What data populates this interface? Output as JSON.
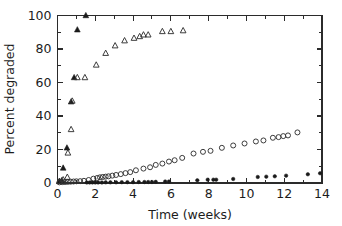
{
  "chart_data": {
    "type": "scatter",
    "title": "",
    "xlabel": "Time (weeks)",
    "ylabel": "Percent degraded",
    "xlim": [
      0,
      14
    ],
    "ylim": [
      0,
      100
    ],
    "xticks": [
      0,
      2,
      4,
      6,
      8,
      10,
      12,
      14
    ],
    "xtick_labels": [
      "0",
      "2",
      "4",
      "6",
      "8",
      "10",
      "12",
      "14"
    ],
    "yticks": [
      0,
      20,
      40,
      60,
      80,
      100
    ],
    "ytick_labels": [
      "0",
      "20",
      "40",
      "60",
      "80",
      "100"
    ],
    "x_minor_ticks": [
      1,
      3,
      5,
      7,
      9,
      11,
      13
    ],
    "y_minor_ticks": [
      10,
      30,
      50,
      70,
      90
    ],
    "grid": false,
    "legend": "none",
    "series": [
      {
        "name": "filled-triangles",
        "marker": "filled-triangle",
        "color": "#1a1a1a",
        "points": [
          [
            0.1,
            1.0
          ],
          [
            0.22,
            1.5
          ],
          [
            0.3,
            9.0
          ],
          [
            0.5,
            21.0
          ],
          [
            0.72,
            48.5
          ],
          [
            0.88,
            63.0
          ],
          [
            1.05,
            91.5
          ],
          [
            1.5,
            100.0
          ]
        ]
      },
      {
        "name": "open-triangles",
        "marker": "open-triangle",
        "color": "#333333",
        "points": [
          [
            0.1,
            1.0
          ],
          [
            0.3,
            2.0
          ],
          [
            0.52,
            3.5
          ],
          [
            0.55,
            18.0
          ],
          [
            0.72,
            32.0
          ],
          [
            0.78,
            49.0
          ],
          [
            1.05,
            63.0
          ],
          [
            1.45,
            63.0
          ],
          [
            2.05,
            70.5
          ],
          [
            2.55,
            77.5
          ],
          [
            3.05,
            82.0
          ],
          [
            3.55,
            85.0
          ],
          [
            4.05,
            86.5
          ],
          [
            4.35,
            87.5
          ],
          [
            4.55,
            88.5
          ],
          [
            4.8,
            88.5
          ],
          [
            5.55,
            90.5
          ],
          [
            6.0,
            90.5
          ],
          [
            6.65,
            91.0
          ]
        ]
      },
      {
        "name": "open-circles",
        "marker": "open-circle",
        "color": "#333333",
        "points": [
          [
            0.1,
            0.4
          ],
          [
            0.25,
            0.5
          ],
          [
            0.4,
            0.6
          ],
          [
            0.55,
            0.7
          ],
          [
            0.7,
            0.8
          ],
          [
            0.85,
            0.9
          ],
          [
            1.0,
            1.0
          ],
          [
            1.2,
            1.1
          ],
          [
            1.4,
            1.3
          ],
          [
            1.65,
            1.8
          ],
          [
            1.9,
            2.6
          ],
          [
            2.1,
            3.0
          ],
          [
            2.25,
            3.4
          ],
          [
            2.4,
            3.6
          ],
          [
            2.55,
            3.8
          ],
          [
            2.7,
            4.0
          ],
          [
            2.9,
            4.4
          ],
          [
            3.1,
            4.8
          ],
          [
            3.35,
            5.3
          ],
          [
            3.6,
            5.9
          ],
          [
            3.85,
            6.5
          ],
          [
            4.15,
            7.6
          ],
          [
            4.55,
            8.6
          ],
          [
            4.9,
            9.4
          ],
          [
            5.2,
            10.8
          ],
          [
            5.55,
            11.6
          ],
          [
            5.9,
            12.8
          ],
          [
            6.2,
            13.6
          ],
          [
            6.6,
            15.0
          ],
          [
            7.2,
            17.6
          ],
          [
            7.7,
            18.6
          ],
          [
            8.1,
            19.2
          ],
          [
            8.7,
            21.0
          ],
          [
            9.3,
            22.4
          ],
          [
            9.9,
            23.6
          ],
          [
            10.5,
            24.8
          ],
          [
            10.9,
            25.4
          ],
          [
            11.4,
            27.0
          ],
          [
            11.7,
            27.4
          ],
          [
            11.95,
            28.0
          ],
          [
            12.2,
            28.4
          ],
          [
            12.7,
            30.2
          ]
        ]
      },
      {
        "name": "filled-circles",
        "marker": "filled-circle",
        "color": "#1a1a1a",
        "points": [
          [
            1.55,
            0.3
          ],
          [
            1.7,
            0.3
          ],
          [
            1.85,
            0.3
          ],
          [
            2.0,
            0.3
          ],
          [
            2.15,
            0.3
          ],
          [
            2.35,
            0.3
          ],
          [
            2.55,
            0.4
          ],
          [
            2.8,
            0.4
          ],
          [
            3.1,
            0.4
          ],
          [
            3.4,
            0.5
          ],
          [
            3.7,
            0.5
          ],
          [
            4.0,
            0.5
          ],
          [
            4.3,
            0.6
          ],
          [
            4.6,
            0.6
          ],
          [
            4.8,
            0.6
          ],
          [
            5.0,
            0.6
          ],
          [
            5.2,
            0.7
          ],
          [
            5.7,
            0.9
          ],
          [
            5.9,
            0.9
          ],
          [
            7.4,
            1.6
          ],
          [
            7.95,
            2.0
          ],
          [
            8.25,
            2.0
          ],
          [
            8.4,
            2.0
          ],
          [
            9.3,
            2.4
          ],
          [
            10.6,
            3.6
          ],
          [
            11.05,
            3.8
          ],
          [
            11.5,
            4.0
          ],
          [
            12.1,
            4.4
          ],
          [
            13.25,
            5.2
          ],
          [
            13.9,
            5.8
          ]
        ]
      }
    ]
  },
  "figure": {
    "background_color": "#ffffff",
    "axis_color": "#2b2b2b"
  }
}
